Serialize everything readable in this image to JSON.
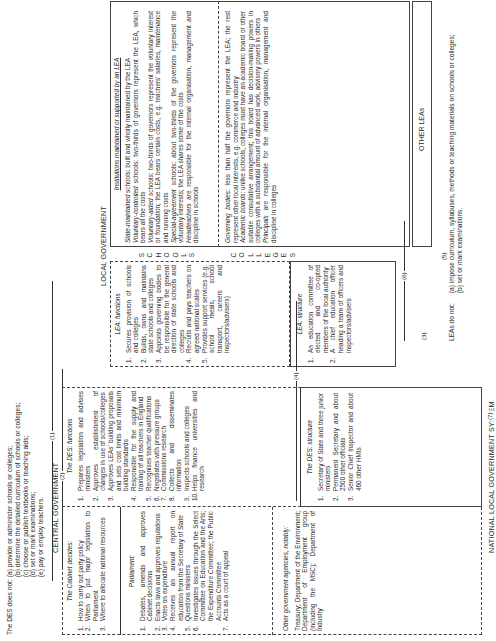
{
  "des_does_not": {
    "lead": "The DES does not:",
    "items": [
      "(a) provide or administer schools or colleges;",
      "(b) determine the detailed curriculum of schools or colleges;",
      "(c) choose or publish textbooks or teaching aids;",
      "(d) set or mark examinations;",
      "(e) pay or employ teachers."
    ]
  },
  "leas_do_not": {
    "lead": "LEAs do not:",
    "items": [
      "(a) impose curriculum, syllabuses, methods or teaching materials on schools or colleges;",
      "(b) set or mark examinations."
    ]
  },
  "central_government": {
    "title": "CENTRAL GOVERNMENT",
    "cabinet": {
      "title": "The Cabinet decides:",
      "items": [
        "How to carry out party policy",
        "When to put major legislation to Parliament",
        "Where to allocate national resources"
      ]
    },
    "parliament": {
      "title": "Parliament:",
      "items": [
        "Debates, amends and approves Cabinet decisions",
        "Enacts laws and approves regulations",
        "Votes on expenditure",
        "Receives an annual report on education from the Secretary of State",
        "Questions ministers",
        "Investigates issues through the Select Committee on Education and the Arts; the Expenditure Committee; the Public Accounts Committee",
        "Acts as a court of appeal"
      ]
    },
    "other_agencies": {
      "title": "Other government agencies, notably:",
      "text": "Treasury; Department of the Environment; Department of Employment group (including the MSC); Department of Industry"
    },
    "des_functions": {
      "title": "The DES: functions",
      "items": [
        "Prepares legislation and advises ministers",
        "Approves establishment of changes in use of schools/colleges",
        "Approves LEAs' building proposals and sets cost limits and minimum building standards",
        "Responsible for the supply and training of all teachers in England",
        "Recognises teacher qualifications",
        "Negotiates with pressure groups",
        "Commissions research",
        "Collects and disseminates information",
        "Inspects schools and colleges",
        "Helps finance universities and research"
      ]
    },
    "des_structure": {
      "title": "The DES: structure",
      "items": [
        "Secretary of State and three junior ministers",
        "Permanent Secretary and about 2500 other officials",
        "Senior Chief Inspector and about 460 other HMIs"
      ]
    }
  },
  "local_government": {
    "title": "LOCAL GOVERNMENT",
    "lea_functions": {
      "title": "LEA: functions",
      "items": [
        "Secures provision of schools and colleges",
        "Builds, owns and maintains state schools and colleges",
        "Appoints governing bodies to be responsible for the general direction of state schools and colleges",
        "Recruits and pays teachers on agreed national scales",
        "Provides support services (e.g. school meals, school transport, careers and inspectors/advisers)"
      ]
    },
    "lea_structure": {
      "title": "LEA: structure",
      "items": [
        "An education committee of elected and co-opted members of the local authority",
        "A chief education officer heading a team of officers and inspectors/advisers"
      ]
    },
    "institutions": {
      "title": "Institutions maintained or supported by an LEA",
      "schools_label": "SCHOOLS",
      "colleges_label": "COLLEGES",
      "schools": [
        {
          "term": "State-maintained",
          "text": " schools: built and wholly maintained by the LEA"
        },
        {
          "term": "Voluntary-controlled",
          "text": " schools: two-thirds of governors represent the LEA, which bears all the costs"
        },
        {
          "term": "Voluntary-aided",
          "text": " schools: two-thirds of governors represent the voluntary interest or foundation; the LEA bears certain costs, e.g. teachers' salaries, maintenance and running costs"
        },
        {
          "term": "Special-agreement",
          "text": " schools: about two-thirds of the governors represent the voluntary interests; the LEA shares some of the costs"
        },
        {
          "term": "Headteachers",
          "text": " are responsible for the internal organisation, management and discipline in schools"
        }
      ],
      "colleges": [
        {
          "term": "Governing bodies",
          "text": ": less than half the governors represent the LEA; the rest represent other local interests, e.g. commerce and industry"
        },
        {
          "term": "Academic boards",
          "text": ": unlike schools, colleges must have an academic board or other suitable consultative arrangement; this board has decision-making powers in colleges with a substantial amount of advanced work, advisory powers in others"
        },
        {
          "term": "Principals",
          "text": " are responsible for the internal organisation, management and discipline in colleges"
        }
      ]
    },
    "other_leas": "OTHER LEAs"
  },
  "national_local_government_system": {
    "title": "NATIONAL LOCAL GOVERNMENT SYSTEM",
    "items": [
      "Organisations representing the professions (teachers, advisers, administrators)",
      "Organisations representing the local authorities (the Association of Metropolitan Authorities (AMA), Association of County Councils (ACC) and their joint education forum, the Council of Local Education Authorities (CLEA))",
      "Organisations representing other parties (interest and pressure groups, examination boards, Schools Curriculum Development Committee, Secondary Examinations Council, Further Education Unit)",
      "Academic research and the education media",
      "Conferences and meetings"
    ]
  },
  "connectors": [
    "(1)",
    "(2)",
    "(3)",
    "(4)",
    "(5)",
    "(6)",
    "(7)"
  ]
}
